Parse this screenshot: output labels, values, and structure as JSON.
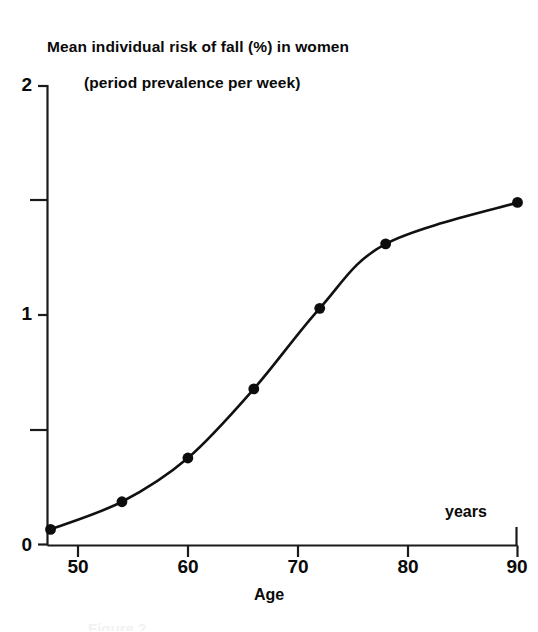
{
  "title": {
    "line1": "Mean individual risk of fall (%) in women",
    "line2": "(period prevalence per week)"
  },
  "axes": {
    "x_title": "Age",
    "x_units_note": "years",
    "y_title": ""
  },
  "caption_fragment": "Figure 2",
  "colors": {
    "line": "#111111",
    "marker": "#0d0d0d",
    "axis": "#1a1a1a",
    "text": "#0a0a0a",
    "background": "#ffffff"
  },
  "chart_data": {
    "type": "line",
    "title": "Mean individual risk of fall (%) in women (period prevalence per week)",
    "xlabel": "Age",
    "ylabel": "Mean individual risk of fall (%)",
    "x_units": "years",
    "xlim": [
      46,
      92
    ],
    "ylim": [
      0,
      2
    ],
    "grid": false,
    "legend": null,
    "x_ticks": [
      50,
      60,
      70,
      80,
      90
    ],
    "x_tick_labels": [
      "50",
      "60",
      "70",
      "80",
      "90"
    ],
    "y_ticks": [
      0,
      1,
      2
    ],
    "y_tick_labels": [
      "0",
      "1",
      "2"
    ],
    "y_minor_ticks": [
      0.5,
      1.5
    ],
    "markers": true,
    "x": [
      47.5,
      54,
      60,
      66,
      72,
      78,
      90
    ],
    "y": [
      0.07,
      0.19,
      0.38,
      0.68,
      1.03,
      1.31,
      1.49
    ],
    "series": [
      {
        "name": "Mean individual risk of fall",
        "points": [
          {
            "age": 47.5,
            "risk": 0.07
          },
          {
            "age": 54,
            "risk": 0.19
          },
          {
            "age": 60,
            "risk": 0.38
          },
          {
            "age": 66,
            "risk": 0.68
          },
          {
            "age": 72,
            "risk": 1.03
          },
          {
            "age": 78,
            "risk": 1.31
          },
          {
            "age": 90,
            "risk": 1.49
          }
        ]
      }
    ]
  }
}
